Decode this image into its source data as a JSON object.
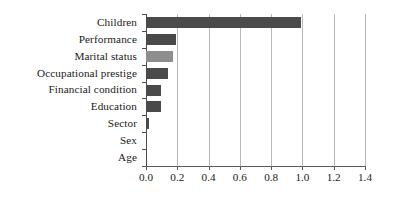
{
  "chart_data": {
    "type": "bar",
    "orientation": "horizontal",
    "title": "",
    "xlabel": "",
    "ylabel": "",
    "xlim": [
      0.0,
      1.4
    ],
    "grid": true,
    "legend": false,
    "categories": [
      "Children",
      "Performance",
      "Marital status",
      "Occupational prestige",
      "Financial condition",
      "Education",
      "Sector",
      "Sex",
      "Age"
    ],
    "values": [
      0.99,
      0.19,
      0.17,
      0.14,
      0.095,
      0.095,
      0.018,
      0.006,
      0.005
    ],
    "bar_colors": [
      "#4a4a4a",
      "#4a4a4a",
      "#8e8e8e",
      "#4a4a4a",
      "#4a4a4a",
      "#4a4a4a",
      "#4a4a4a",
      "#4a4a4a",
      "#4a4a4a"
    ],
    "xticks": [
      0.0,
      0.2,
      0.4,
      0.6,
      0.8,
      1.0,
      1.2,
      1.4
    ],
    "xtick_labels": [
      "0.0",
      "0.2",
      "0.4",
      "0.6",
      "0.8",
      "1.0",
      "1.2",
      "1.4"
    ],
    "colors": {
      "bar_dark": "#4a4a4a",
      "bar_light": "#8e8e8e",
      "gridline": "#b9b9b9",
      "axis": "#4d4d4d",
      "text": "#1a1a1a",
      "background": "#ffffff"
    }
  }
}
